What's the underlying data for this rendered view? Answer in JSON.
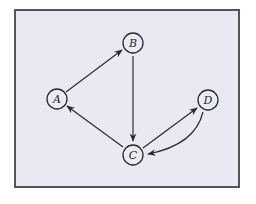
{
  "diagram": {
    "type": "directed-graph",
    "colors": {
      "background": "#e9e9f3",
      "border": "#555559",
      "stroke": "#2a2a2e"
    },
    "nodes": [
      {
        "id": "A",
        "label": "A",
        "x": 57,
        "y": 99
      },
      {
        "id": "B",
        "label": "B",
        "x": 133,
        "y": 43
      },
      {
        "id": "C",
        "label": "C",
        "x": 133,
        "y": 155
      },
      {
        "id": "D",
        "label": "D",
        "x": 208,
        "y": 100
      }
    ],
    "edges": [
      {
        "from": "A",
        "to": "B",
        "curved": false
      },
      {
        "from": "B",
        "to": "C",
        "curved": false
      },
      {
        "from": "C",
        "to": "A",
        "curved": false
      },
      {
        "from": "C",
        "to": "D",
        "curved": false
      },
      {
        "from": "D",
        "to": "C",
        "curved": true
      }
    ]
  }
}
